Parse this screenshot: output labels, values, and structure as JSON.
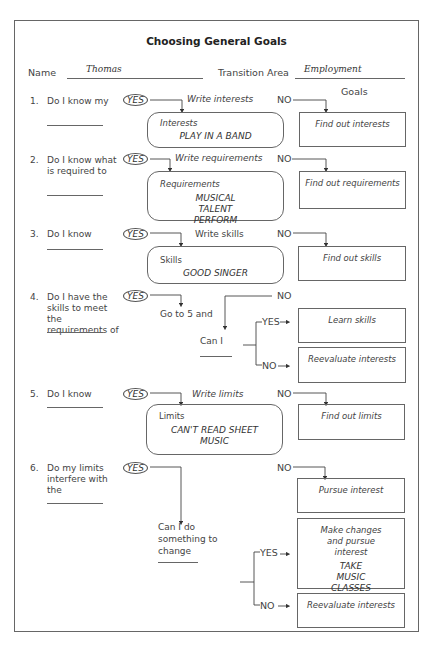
{
  "title": "Choosing General Goals",
  "header": {
    "name_label": "Name",
    "name_value": "Thomas",
    "area_label": "Transition Area",
    "area_value": "Employment",
    "goals_label": "Goals"
  },
  "yes_label": "YES",
  "no_label": "NO",
  "questions": [
    {
      "num": "1.",
      "text": "Do I know my",
      "yes_action": "Write interests",
      "box_label": "Interests",
      "box_value": "PLAY IN A BAND",
      "no_goal": "Find out interests"
    },
    {
      "num": "2.",
      "text": "Do I know what is required to",
      "yes_action": "Write requirements",
      "box_label": "Requirements",
      "box_value": "MUSICAL TALENT PERFORM",
      "no_goal": "Find out requirements"
    },
    {
      "num": "3.",
      "text": "Do I know",
      "yes_action": "Write skills",
      "box_label": "Skills",
      "box_value": "GOOD SINGER",
      "no_goal": "Find out skills"
    },
    {
      "num": "4.",
      "text": "Do I have the skills to meet the requirements of",
      "yes_action": "Go to 5 and",
      "sub_question": "Can I",
      "sub_yes": "YES",
      "sub_no": "NO",
      "yes_goal": "Learn skills",
      "no_goal": "Reevaluate interests"
    },
    {
      "num": "5.",
      "text": "Do I know",
      "yes_action": "Write limits",
      "box_label": "Limits",
      "box_value": "CAN'T READ SHEET MUSIC",
      "no_goal": "Find out limits"
    },
    {
      "num": "6.",
      "text": "Do my limits interfere with the",
      "sub_question": "Can I do something to change",
      "no_goal": "Pursue interest",
      "yes_goal": "Make changes and pursue interest",
      "yes_goal_value": "TAKE MUSIC CLASSES",
      "sub_yes": "YES",
      "sub_no": "NO",
      "sub_no_goal": "Reevaluate interests"
    }
  ]
}
